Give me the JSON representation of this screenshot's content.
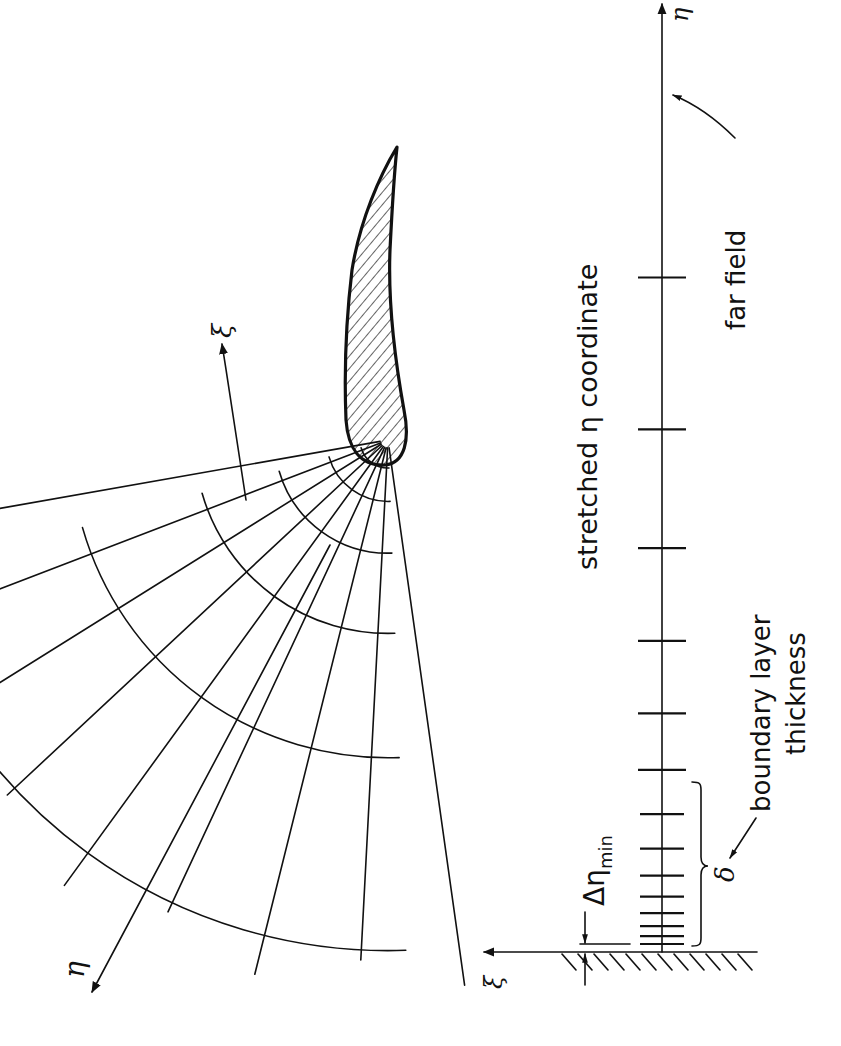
{
  "figure": {
    "orientation": "rotated 90 degrees counter-clockwise",
    "ink_color": "#111111",
    "background_color": "#ffffff"
  },
  "grid_view": {
    "body": "airfoil (hatched cross-section)",
    "axes": {
      "xi_label": "ξ",
      "eta_label": "η"
    },
    "radial_line_count": 9,
    "arc_line_count": 6
  },
  "stretched_axis": {
    "axis_label": "η",
    "wall_axis_label": "ξ",
    "title": "stretched η coordinate",
    "far_field_label": "far field",
    "boundary_layer_label_line1": "boundary layer",
    "boundary_layer_label_line2": "thickness",
    "delta_symbol": "δ",
    "delta_eta_min_prefix": "Δη",
    "delta_eta_min_subscript": "min",
    "tick_count": 14,
    "ticks_inside_boundary_layer": 8
  }
}
